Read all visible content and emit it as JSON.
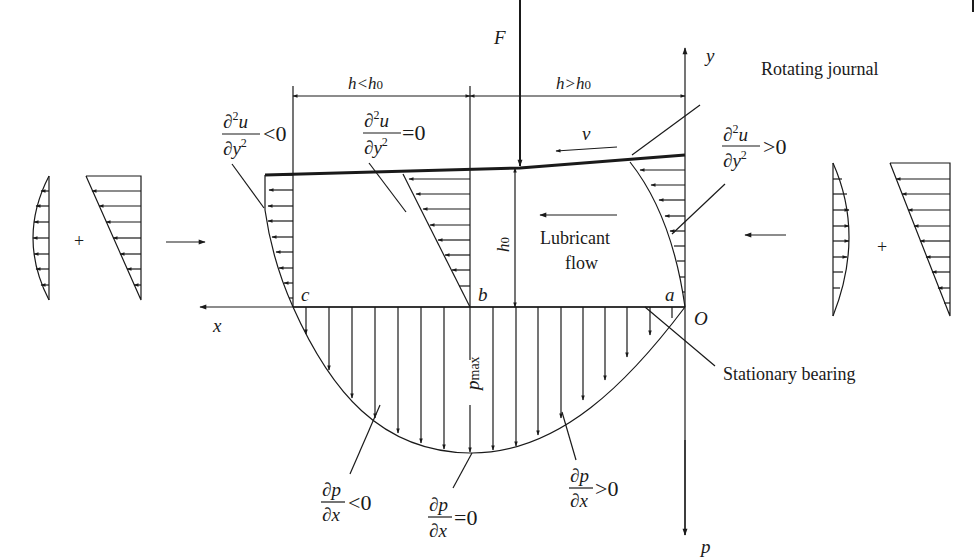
{
  "figure": {
    "type": "hydrodynamic lubrication wedge diagram",
    "colors": {
      "ink": "#1a1a1a",
      "background": "#ffffff"
    }
  },
  "labels": {
    "force": "F",
    "y_axis": "y",
    "x_axis": "x",
    "p_axis": "p",
    "origin": "O",
    "point_a": "a",
    "point_b": "b",
    "point_c": "c",
    "velocity": "v",
    "h0": "h0",
    "h0_base": "h",
    "h0_sub": "0",
    "pmax_base": "p",
    "pmax_sub": "max",
    "plus_left": "+",
    "plus_right": "+"
  },
  "dimensions": {
    "left_span": {
      "base": "h<h",
      "sub": "0"
    },
    "right_span": {
      "base": "h>h",
      "sub": "0"
    }
  },
  "callouts": {
    "rotating_journal": "Rotating journal",
    "stationary_bearing": "Stationary bearing",
    "lubricant_flow_line1": "Lubricant",
    "lubricant_flow_line2": "flow"
  },
  "equations": {
    "d2u_lt": {
      "num": "∂²u",
      "num_base": "∂",
      "num_sup": "2",
      "num_var": "u",
      "den_base": "∂y",
      "den_sup": "2",
      "rel": "<0"
    },
    "d2u_eq": {
      "num_base": "∂",
      "num_sup": "2",
      "num_var": "u",
      "den_base": "∂y",
      "den_sup": "2",
      "rel": "=0"
    },
    "d2u_gt": {
      "num_base": "∂",
      "num_sup": "2",
      "num_var": "u",
      "den_base": "∂y",
      "den_sup": "2",
      "rel": ">0"
    },
    "dp_lt": {
      "num": "∂p",
      "den": "∂x",
      "rel": "<0"
    },
    "dp_eq": {
      "num": "∂p",
      "den": "∂x",
      "rel": "=0"
    },
    "dp_gt": {
      "num": "∂p",
      "den": "∂x",
      "rel": ">0"
    }
  }
}
